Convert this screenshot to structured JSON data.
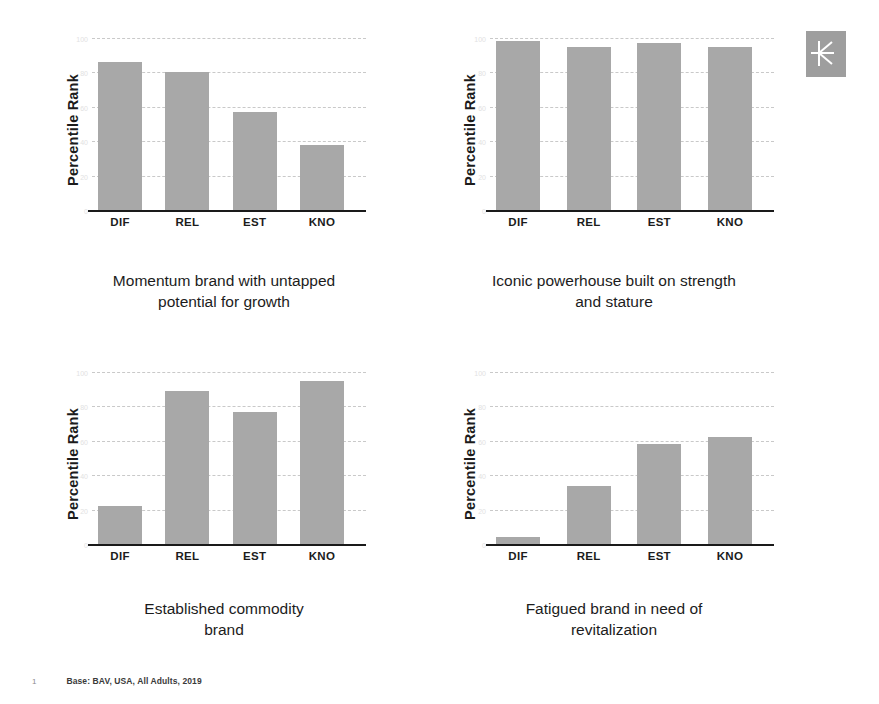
{
  "logo": {
    "name": "kantar-logo-mark",
    "background_color": "#9e9e9e",
    "glyph_color": "#ffffff"
  },
  "footer": {
    "page_number": "1",
    "source_note": "Base: BAV, USA, All Adults, 2019"
  },
  "axis": {
    "y_title": "Percentile Rank",
    "categories": [
      "DIF",
      "REL",
      "EST",
      "KNO"
    ],
    "y_ticks": [
      "0",
      "20",
      "40",
      "60",
      "80",
      "100"
    ],
    "y_min": 0,
    "y_max": 100
  },
  "colors": {
    "bar": "#a8a8a8",
    "gridline": "#c9c9c9",
    "baseline": "#1a1a1a",
    "text": "#1c1c1c"
  },
  "quadrants": [
    {
      "id": "momentum-brand",
      "caption_line1": "Momentum brand with untapped",
      "caption_line2": "potential for growth"
    },
    {
      "id": "iconic-powerhouse",
      "caption_line1": "Iconic powerhouse  built on strength",
      "caption_line2": "and stature"
    },
    {
      "id": "established-commodity",
      "caption_line1": "Established commodity",
      "caption_line2": "brand"
    },
    {
      "id": "fatigued-brand",
      "caption_line1": "Fatigued brand in need of",
      "caption_line2": "revitalization"
    }
  ],
  "chart_data": [
    {
      "type": "bar",
      "title": "Momentum brand with untapped potential for growth",
      "categories": [
        "DIF",
        "REL",
        "EST",
        "KNO"
      ],
      "values": [
        86,
        80,
        57,
        38
      ],
      "xlabel": "",
      "ylabel": "Percentile Rank",
      "ylim": [
        0,
        100
      ],
      "yticks": [
        0,
        20,
        40,
        60,
        80,
        100
      ],
      "grid": true,
      "legend": "none"
    },
    {
      "type": "bar",
      "title": "Iconic powerhouse built on strength and stature",
      "categories": [
        "DIF",
        "REL",
        "EST",
        "KNO"
      ],
      "values": [
        98,
        95,
        97,
        95
      ],
      "xlabel": "",
      "ylabel": "Percentile Rank",
      "ylim": [
        0,
        100
      ],
      "yticks": [
        0,
        20,
        40,
        60,
        80,
        100
      ],
      "grid": true,
      "legend": "none"
    },
    {
      "type": "bar",
      "title": "Established commodity brand",
      "categories": [
        "DIF",
        "REL",
        "EST",
        "KNO"
      ],
      "values": [
        22,
        89,
        77,
        95
      ],
      "xlabel": "",
      "ylabel": "Percentile Rank",
      "ylim": [
        0,
        100
      ],
      "yticks": [
        0,
        20,
        40,
        60,
        80,
        100
      ],
      "grid": true,
      "legend": "none"
    },
    {
      "type": "bar",
      "title": "Fatigued brand in need of revitalization",
      "categories": [
        "DIF",
        "REL",
        "EST",
        "KNO"
      ],
      "values": [
        4,
        34,
        58,
        62
      ],
      "xlabel": "",
      "ylabel": "Percentile Rank",
      "ylim": [
        0,
        100
      ],
      "yticks": [
        0,
        20,
        40,
        60,
        80,
        100
      ],
      "grid": true,
      "legend": "none"
    }
  ]
}
